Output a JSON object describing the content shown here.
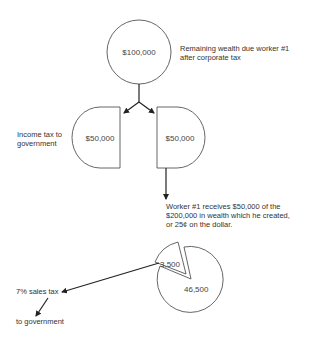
{
  "diagram": {
    "top_node": {
      "value": "$100,000",
      "caption_line1": "Remaining wealth due worker #1",
      "caption_line2": "after corporate tax"
    },
    "left_node": {
      "value": "$50,000",
      "caption_line1": "Income tax to",
      "caption_line2": "government"
    },
    "right_node": {
      "value": "$50,000"
    },
    "worker_note": {
      "line1": "Worker #1 receives $50,000 of the",
      "line2": "$200,000 in wealth which he created,",
      "line3": "or 25¢ on the dollar."
    },
    "pie": {
      "slice_small": "3,500",
      "slice_large": "46,500"
    },
    "sales_tax_label": "7% sales tax",
    "to_government_label": "to government",
    "colors": {
      "stroke": "#555555",
      "arrow": "#222222",
      "text": "#333333"
    }
  }
}
